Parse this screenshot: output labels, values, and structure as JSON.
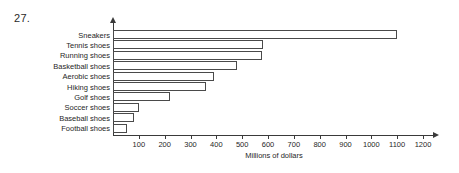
{
  "problem_number": "27.",
  "chart_data": {
    "type": "bar",
    "orientation": "horizontal",
    "title": "",
    "xlabel": "Millions of dollars",
    "ylabel": "",
    "xlim": [
      0,
      1200
    ],
    "xticks": [
      100,
      200,
      300,
      400,
      500,
      600,
      700,
      800,
      900,
      1000,
      1100,
      1200
    ],
    "xtick_labels": [
      "100",
      "200",
      "300",
      "400",
      "500",
      "600",
      "700",
      "800",
      "900",
      "1000",
      "1100",
      "1200"
    ],
    "grid": false,
    "legend": false,
    "categories": [
      "Sneakers",
      "Tennis shoes",
      "Running shoes",
      "Basketball shoes",
      "Aerobic shoes",
      "Hiking shoes",
      "Golf shoes",
      "Soccer shoes",
      "Baseball shoes",
      "Football shoes"
    ],
    "values": [
      1100,
      580,
      575,
      480,
      390,
      360,
      220,
      100,
      80,
      55
    ],
    "bar_fill": "#ffffff",
    "bar_edge": "#4a4a4a",
    "axis_color": "#3a3a3a",
    "background": "#ffffff"
  }
}
